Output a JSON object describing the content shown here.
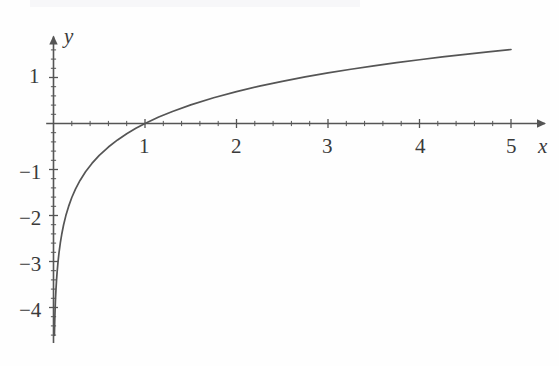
{
  "figure": {
    "width": 559,
    "height": 366,
    "background_color": "#fefefe",
    "ink_color": "#555555",
    "label_color": "#3a3a3a"
  },
  "axes": {
    "x_axis_name": "x",
    "y_axis_name": "y",
    "x_arrow": "arrow-right",
    "y_arrow": "arrow-up"
  },
  "chart_data": {
    "type": "line",
    "title": "",
    "subtitle": "",
    "xlabel": "x",
    "ylabel": "y",
    "function": "y = ln(x)",
    "xlim": [
      -0.08,
      5.35
    ],
    "ylim": [
      -4.75,
      1.85
    ],
    "grid": false,
    "legend": null,
    "x_ticks_major": [
      1,
      2,
      3,
      4,
      5
    ],
    "x_tick_labels": [
      "1",
      "2",
      "3",
      "4",
      "5"
    ],
    "x_minor_tick_step": 0.2,
    "y_ticks_major": [
      1,
      -1,
      -2,
      -3,
      -4
    ],
    "y_tick_labels": [
      "1",
      "−1",
      "−2",
      "−3",
      "−4"
    ],
    "y_minor_tick_step": 0.2,
    "series": [
      {
        "name": "y = ln(x)",
        "color": "#555555",
        "x": [
          0.01,
          0.012,
          0.015,
          0.018,
          0.022,
          0.027,
          0.033,
          0.04,
          0.05,
          0.06,
          0.075,
          0.09,
          0.11,
          0.135,
          0.165,
          0.2,
          0.24,
          0.29,
          0.35,
          0.42,
          0.5,
          0.6,
          0.7,
          0.8,
          0.9,
          1.0,
          1.15,
          1.3,
          1.5,
          1.75,
          2.0,
          2.25,
          2.5,
          2.75,
          3.0,
          3.25,
          3.5,
          3.75,
          4.0,
          4.25,
          4.5,
          4.75,
          5.0
        ],
        "y": [
          -4.605,
          -4.423,
          -4.2,
          -4.017,
          -3.817,
          -3.612,
          -3.411,
          -3.219,
          -2.996,
          -2.813,
          -2.59,
          -2.408,
          -2.207,
          -2.002,
          -1.802,
          -1.609,
          -1.427,
          -1.238,
          -1.05,
          -0.868,
          -0.693,
          -0.511,
          -0.357,
          -0.223,
          -0.105,
          0.0,
          0.14,
          0.262,
          0.405,
          0.56,
          0.693,
          0.811,
          0.916,
          1.012,
          1.099,
          1.179,
          1.253,
          1.322,
          1.386,
          1.447,
          1.504,
          1.558,
          1.609
        ]
      }
    ],
    "annotations": [
      {
        "text": "vertical asymptote at x = 0",
        "visible": false
      }
    ]
  },
  "tick_labels": {
    "x": [
      {
        "text": "1",
        "value": 1
      },
      {
        "text": "2",
        "value": 2
      },
      {
        "text": "3",
        "value": 3
      },
      {
        "text": "4",
        "value": 4
      },
      {
        "text": "5",
        "value": 5
      }
    ],
    "y": [
      {
        "text": "1",
        "value": 1
      },
      {
        "text": "−1",
        "value": -1
      },
      {
        "text": "−2",
        "value": -2
      },
      {
        "text": "−3",
        "value": -3
      },
      {
        "text": "−4",
        "value": -4
      }
    ]
  }
}
